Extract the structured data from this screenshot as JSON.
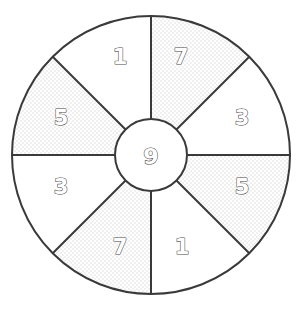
{
  "figure": {
    "kind": "segmented-wheel-diagram",
    "background_color": "#ffffff",
    "stroke_color": "#3a3a3a",
    "plain_fill_color": "#ffffff",
    "textured_fill_color": "#f2f2f2",
    "label_fill_color": "#ffffff",
    "label_outline_color": "#4a4a4a"
  },
  "chart_data": {
    "type": "pie",
    "title": "",
    "subtitle": "",
    "xlabel": "",
    "ylabel": "",
    "legend": [],
    "annotations": [],
    "grid": false,
    "geometry": {
      "center_x": 151,
      "center_y": 155,
      "outer_radius": 139,
      "hub_radius": 36,
      "sector_count": 8,
      "sector_span_degrees": 45,
      "spoke_angles_degrees": [
        0,
        45,
        90,
        135,
        180,
        225,
        270,
        315
      ]
    },
    "hub": {
      "label": "9",
      "fill": "plain"
    },
    "categories": [
      "top-right",
      "right-upper",
      "right-lower",
      "bottom-right",
      "bottom-left",
      "left-lower",
      "left-upper",
      "top-left"
    ],
    "values": [
      7,
      3,
      5,
      1,
      7,
      3,
      5,
      1
    ],
    "sectors": [
      {
        "label": "7",
        "value": 7,
        "position": "top-right",
        "start_angle": -90,
        "end_angle": -45,
        "fill": "textured",
        "label_x": 181,
        "label_y": 57
      },
      {
        "label": "3",
        "value": 3,
        "position": "right-upper",
        "start_angle": -45,
        "end_angle": 0,
        "fill": "plain",
        "label_x": 242,
        "label_y": 118
      },
      {
        "label": "5",
        "value": 5,
        "position": "right-lower",
        "start_angle": 0,
        "end_angle": 45,
        "fill": "textured",
        "label_x": 242,
        "label_y": 187
      },
      {
        "label": "1",
        "value": 1,
        "position": "bottom-right",
        "start_angle": 45,
        "end_angle": 90,
        "fill": "plain",
        "label_x": 182,
        "label_y": 247
      },
      {
        "label": "7",
        "value": 7,
        "position": "bottom-left",
        "start_angle": 90,
        "end_angle": 135,
        "fill": "textured",
        "label_x": 120,
        "label_y": 247
      },
      {
        "label": "3",
        "value": 3,
        "position": "left-lower",
        "start_angle": 135,
        "end_angle": 180,
        "fill": "plain",
        "label_x": 61,
        "label_y": 187
      },
      {
        "label": "5",
        "value": 5,
        "position": "left-upper",
        "start_angle": 180,
        "end_angle": 225,
        "fill": "textured",
        "label_x": 61,
        "label_y": 118
      },
      {
        "label": "1",
        "value": 1,
        "position": "top-left",
        "start_angle": 225,
        "end_angle": 270,
        "fill": "plain",
        "label_x": 120,
        "label_y": 57
      }
    ]
  }
}
